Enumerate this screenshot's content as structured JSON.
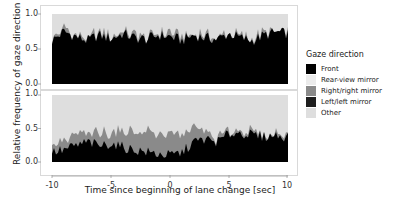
{
  "chart_data": {
    "type": "area",
    "stacked": true,
    "title": "",
    "xlabel": "Time since beginning of lane change [sec]",
    "ylabel": "Relative frequency of gaze direction",
    "xlim": [
      -10,
      10
    ],
    "ylim": [
      0,
      1
    ],
    "x_ticks": [
      "-10",
      "-5",
      "0",
      "5",
      "10"
    ],
    "y_ticks": [
      "0.0",
      "0.5",
      "1.0"
    ],
    "grid": false,
    "legend": {
      "title": "Gaze direction",
      "position": "right",
      "entries": [
        {
          "name": "Front",
          "color": "#000000"
        },
        {
          "name": "Rear-view mirror",
          "color": "#e6e6e6"
        },
        {
          "name": "Right/right mirror",
          "color": "#8c8c8c"
        },
        {
          "name": "Left/left mirror",
          "color": "#1e1e1e"
        },
        {
          "name": "Other",
          "color": "#dcdcdc"
        }
      ]
    },
    "x": [
      -10,
      -9,
      -8,
      -7,
      -6,
      -5,
      -4,
      -3,
      -2,
      -1,
      0,
      1,
      2,
      3,
      4,
      5,
      6,
      7,
      8,
      9,
      10
    ],
    "panels": [
      {
        "name": "top",
        "series": [
          {
            "name": "Front",
            "values": [
              0.62,
              0.75,
              0.68,
              0.62,
              0.7,
              0.65,
              0.72,
              0.66,
              0.64,
              0.7,
              0.68,
              0.62,
              0.7,
              0.66,
              0.64,
              0.72,
              0.66,
              0.62,
              0.7,
              0.74,
              0.72
            ]
          },
          {
            "name": "Right/right mirror",
            "values": [
              0.02,
              0.03,
              0.02,
              0.03,
              0.04,
              0.03,
              0.04,
              0.05,
              0.04,
              0.06,
              0.05,
              0.04,
              0.03,
              0.03,
              0.02,
              0.02,
              0.02,
              0.02,
              0.02,
              0.02,
              0.02
            ]
          },
          {
            "name": "Other",
            "values": [
              0.36,
              0.22,
              0.3,
              0.35,
              0.26,
              0.32,
              0.24,
              0.29,
              0.32,
              0.24,
              0.27,
              0.34,
              0.27,
              0.31,
              0.34,
              0.26,
              0.32,
              0.36,
              0.28,
              0.24,
              0.26
            ]
          }
        ]
      },
      {
        "name": "bottom",
        "series": [
          {
            "name": "Front",
            "values": [
              0.15,
              0.18,
              0.24,
              0.3,
              0.24,
              0.28,
              0.22,
              0.18,
              0.15,
              0.12,
              0.1,
              0.14,
              0.3,
              0.34,
              0.3,
              0.42,
              0.44,
              0.4,
              0.38,
              0.4,
              0.38
            ]
          },
          {
            "name": "Right/right mirror",
            "values": [
              0.1,
              0.12,
              0.14,
              0.12,
              0.18,
              0.16,
              0.24,
              0.26,
              0.3,
              0.3,
              0.32,
              0.28,
              0.22,
              0.1,
              0.06,
              0.04,
              0.04,
              0.02,
              0.02,
              0.02,
              0.02
            ]
          },
          {
            "name": "Other",
            "values": [
              0.75,
              0.7,
              0.62,
              0.58,
              0.58,
              0.56,
              0.54,
              0.56,
              0.55,
              0.58,
              0.58,
              0.58,
              0.48,
              0.56,
              0.64,
              0.54,
              0.52,
              0.58,
              0.6,
              0.58,
              0.6
            ]
          }
        ]
      }
    ]
  },
  "axes": {
    "ylabel": "Relative frequency of gaze direction",
    "xlabel": "Time since beginning of lane change  [sec]",
    "top_yticks": [
      "1.0",
      "0.5",
      "0.0"
    ],
    "bottom_yticks": [
      "1.0",
      "0.5",
      "0.0"
    ],
    "xticks": [
      "-10",
      "-5",
      "0",
      "5",
      "10"
    ]
  },
  "legend": {
    "title": "Gaze direction",
    "items": [
      {
        "label": "Front",
        "color": "#000000"
      },
      {
        "label": "Rear-view mirror",
        "color": "#ebebeb"
      },
      {
        "label": "Right/right mirror",
        "color": "#8a8a8a"
      },
      {
        "label": "Left/left mirror",
        "color": "#1e1e1e"
      },
      {
        "label": "Other",
        "color": "#dedede"
      }
    ]
  }
}
